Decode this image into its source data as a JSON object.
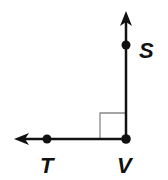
{
  "diagram": {
    "type": "geometry-right-angle",
    "colors": {
      "line": "#111111",
      "angle_marker": "#888888",
      "background": "#ffffff"
    },
    "vertex": {
      "label": "V",
      "x": 126,
      "y": 139
    },
    "points": [
      {
        "label": "S",
        "x": 126,
        "y": 45,
        "on_ray": "VS"
      },
      {
        "label": "T",
        "x": 47,
        "y": 139,
        "on_ray": "VT"
      }
    ],
    "rays": [
      {
        "name": "VS",
        "from": [
          126,
          139
        ],
        "to": [
          126,
          12
        ],
        "direction": "up"
      },
      {
        "name": "VT",
        "from": [
          126,
          139
        ],
        "to": [
          15,
          139
        ],
        "direction": "left"
      }
    ],
    "right_angle_marker": {
      "x": 100,
      "y": 113,
      "size": 26
    },
    "labels": {
      "S": "S",
      "T": "T",
      "V": "V"
    }
  }
}
